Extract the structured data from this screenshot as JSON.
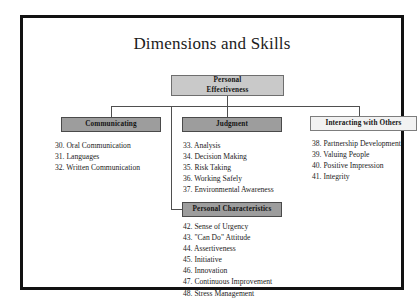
{
  "figure": {
    "title": "Dimensions and Skills"
  },
  "nodes": {
    "root": "Personal\nEffectiveness",
    "root_line1": "Personal",
    "root_line2": "Effectiveness",
    "communicating": "Communicating",
    "judgment": "Judgment",
    "interacting": "Interacting with Others",
    "characteristics": "Personal Characteristics"
  },
  "lists": {
    "communicating": [
      "30. Oral Communication",
      "31. Languages",
      "32. Written Communication"
    ],
    "judgment": [
      "33. Analysis",
      "34. Decision Making",
      "35. Risk Taking",
      "36. Working Safely",
      "37. Environmental Awareness"
    ],
    "interacting": [
      "38. Partnership Development",
      "39. Valuing People",
      "40. Positive Impression",
      "41. Integrity"
    ],
    "characteristics": [
      "42. Sense of Urgency",
      "43. \"Can Do\" Attitude",
      "44. Assertiveness",
      "45. Initiative",
      "46. Innovation",
      "47. Continuous Improvement",
      "48. Stress Management"
    ]
  },
  "colors": {
    "frame_border": "#121212",
    "root_fill": "#c9c9c9",
    "branch_fill": "#9d9d9d",
    "pale_fill": "#f2f2f2",
    "connector": "#4f4f4f",
    "text": "#1a1a1a"
  }
}
